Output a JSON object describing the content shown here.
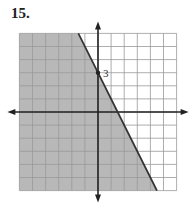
{
  "problem_number": "15.",
  "chart_data": {
    "type": "line",
    "title": "",
    "xlabel": "",
    "ylabel": "",
    "xlim": [
      -6,
      6
    ],
    "ylim": [
      -6,
      6
    ],
    "grid": true,
    "lines": [
      {
        "equation": "y = -2x + 3",
        "slope": -2,
        "intercept": 3,
        "style": "solid"
      }
    ],
    "shaded_region": "below-left of line (y <= -2x + 3)",
    "points": [
      {
        "x": 0,
        "y": 3,
        "label": "3"
      }
    ],
    "annotations": [
      "3"
    ],
    "colors": {
      "shade": "#b8b8b8",
      "grid": "#999999",
      "axis": "#222222"
    }
  }
}
